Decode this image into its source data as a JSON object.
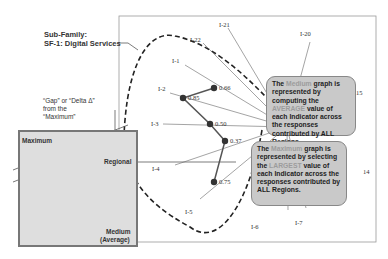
{
  "subfamily": {
    "line1": "Sub-Family:",
    "line2": "SF-1:  Digital Services"
  },
  "gap_label": {
    "line1": "“Gap” or “Delta  Δ”",
    "line2": "from the",
    "line3": "“Maximum”"
  },
  "inset": {
    "maximum_label": "Maximum",
    "regional_label": "Regional",
    "medium_label": "Medium",
    "average_label": "(Average)"
  },
  "axes": [
    {
      "id": "I-21",
      "label": "I-21"
    },
    {
      "id": "I-22",
      "label": "I-22"
    },
    {
      "id": "I-20",
      "label": "I-20"
    },
    {
      "id": "I-1",
      "label": "I-1"
    },
    {
      "id": "I-2",
      "label": "I-2"
    },
    {
      "id": "I-3",
      "label": "I-3"
    },
    {
      "id": "I-4",
      "label": "I-4"
    },
    {
      "id": "I-5",
      "label": "I-5"
    },
    {
      "id": "I-6",
      "label": "I-6"
    },
    {
      "id": "I-7",
      "label": "I-7"
    },
    {
      "id": "I-14",
      "label": "14"
    },
    {
      "id": "I-15",
      "label": "15"
    }
  ],
  "points": [
    {
      "axis": "I-1",
      "value": "0.66"
    },
    {
      "axis": "I-2",
      "value": "0.85"
    },
    {
      "axis": "I-3",
      "value": "0.50"
    },
    {
      "axis": "I-4",
      "value": "0.37"
    },
    {
      "axis": "I-5",
      "value": "0.75"
    }
  ],
  "callout_medium": {
    "p1": "The ",
    "hl1": "Medium",
    "p2": " graph is represented by computing the ",
    "hl2": "AVERAGE",
    "p3": " value of each Indicator across the responses contributed by ALL Regions."
  },
  "callout_maximum": {
    "p1": "The ",
    "hl1": "Maximum",
    "p2": " graph is represented by selecting the ",
    "hl2": "LARGEST",
    "p3": " value of each Indicator across the responses contributed by ALL Regions."
  },
  "colors": {
    "callout_bg": "#c9c9c9",
    "inset_bg": "#dedede",
    "point": "#333333"
  }
}
